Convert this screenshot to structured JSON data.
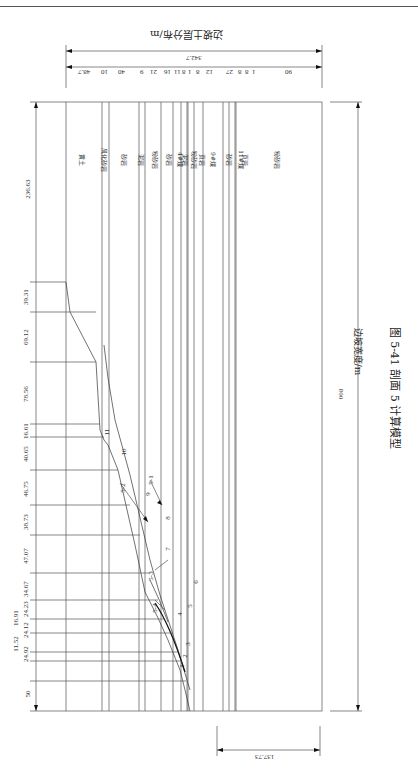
{
  "page": {
    "page_number": "",
    "running_header": ""
  },
  "figure": {
    "caption": "图 5-41   剖面 5 计算模型",
    "x_axis_label": "边坡宽度/m",
    "layer_title": "边坡土层分布/m",
    "total_width": "800",
    "total_layer_thickness": "342.7",
    "base_height": "137.73",
    "layer_thicknesses": [
      "48.7",
      "10",
      "40",
      "9",
      "21",
      "16",
      "11",
      "8",
      "1",
      "8",
      "12",
      "27",
      "8",
      "8",
      "1",
      "90"
    ],
    "layers": [
      {
        "name": "黄土"
      },
      {
        "name": "风化砂岩"
      },
      {
        "name": "砂岩"
      },
      {
        "name": "泥岩"
      },
      {
        "name": "粉砂岩"
      },
      {
        "name": "砂岩"
      },
      {
        "name": "4#煤"
      },
      {
        "name": "泥岩"
      },
      {
        "name": "粉砂岩"
      },
      {
        "name": "页岩"
      },
      {
        "name": "9#煤"
      },
      {
        "name": "砂岩"
      },
      {
        "name": "11#煤"
      },
      {
        "name": "页岩"
      },
      {
        "name": "粉砂岩"
      }
    ],
    "slope_segments": [
      "236.63",
      "39.31",
      "69.12",
      "78.56",
      "16.61",
      "40.65",
      "46.75",
      "38.73",
      "47.07",
      "34.67",
      "24.23",
      "16.91",
      "24.12",
      "11.52",
      "24.92",
      "50"
    ],
    "bench_labels": [
      "1",
      "2",
      "3",
      "4",
      "5",
      "6",
      "7",
      "8",
      "9",
      "10",
      "11"
    ],
    "slide_labels": [
      "5-1",
      "5-2",
      "5-3",
      "5-4"
    ]
  }
}
